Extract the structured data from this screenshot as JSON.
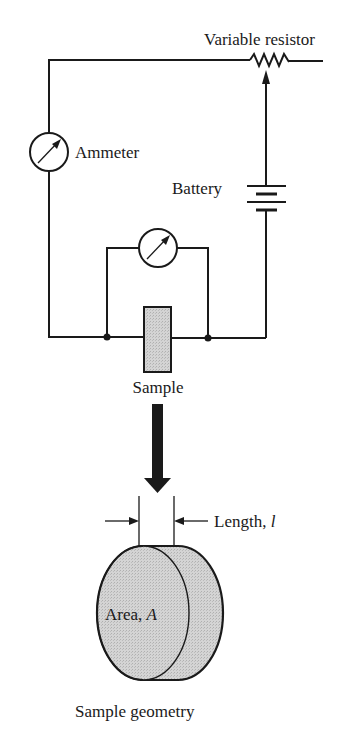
{
  "figure": {
    "labels": {
      "variable_resistor": "Variable resistor",
      "ammeter": "Ammeter",
      "battery": "Battery",
      "sample": "Sample",
      "length_prefix": "Length, ",
      "length_symbol": "l",
      "area_prefix": "Area, ",
      "area_symbol": "A",
      "sample_geometry": "Sample geometry"
    },
    "components": [
      {
        "type": "variable-resistor",
        "label": "Variable resistor"
      },
      {
        "type": "ammeter",
        "label": "Ammeter"
      },
      {
        "type": "battery",
        "label": "Battery"
      },
      {
        "type": "voltmeter",
        "label": ""
      },
      {
        "type": "sample",
        "label": "Sample"
      }
    ],
    "colors": {
      "line": "#1a1a1a",
      "sample_fill": "#cfcfcf",
      "background": "#ffffff"
    }
  }
}
